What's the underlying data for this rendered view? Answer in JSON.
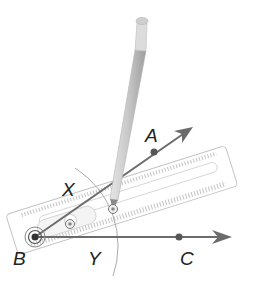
{
  "diagram": {
    "labels": {
      "vertex": "B",
      "point_a": "A",
      "point_c": "C",
      "arc_point_x": "X",
      "arc_point_y": "Y"
    },
    "colors": {
      "ray": "#6b6b6b",
      "point": "#555555",
      "arc": "#9a9a9a",
      "ruler_outline": "#bdbdbd",
      "pencil": "#d2d2d2",
      "label": "#222222"
    },
    "icons": {
      "compass_pivot": "pivot-icon",
      "hinge": "hinge-icon",
      "pencil": "pencil-icon",
      "ruler": "ruler-icon"
    }
  }
}
